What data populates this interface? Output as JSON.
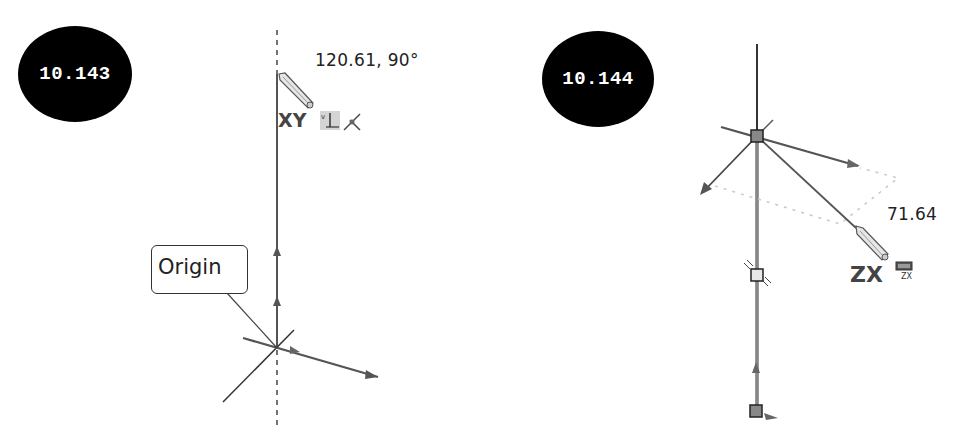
{
  "figures": [
    {
      "id_label": "10.143",
      "dimension_readout": "120.61, 90°",
      "plane_label": "XY",
      "callout": "Origin",
      "icons": [
        "pencil-cursor-icon",
        "vertical-relation-icon",
        "coincident-point-icon"
      ]
    },
    {
      "id_label": "10.144",
      "dimension_readout": "71.64",
      "plane_label": "ZX",
      "plane_icon_label": "ZX",
      "icons": [
        "pencil-cursor-icon",
        "zx-plane-icon"
      ]
    }
  ],
  "colors": {
    "background": "#ffffff",
    "badge": "#000000",
    "badge_text": "#ffffff",
    "line": "#555555",
    "construction": "#bbbbbb"
  }
}
